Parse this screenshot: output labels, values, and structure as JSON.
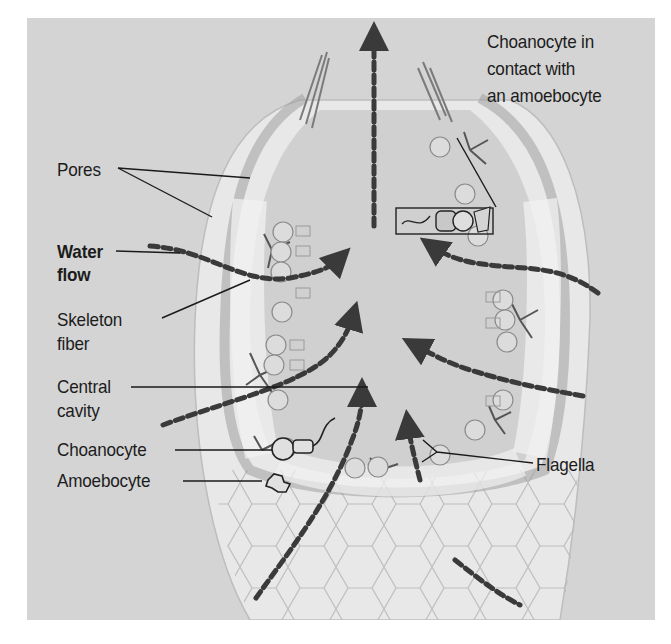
{
  "diagram": {
    "labels": {
      "pores": "Pores",
      "water_flow_line1": "Water",
      "water_flow_line2": "flow",
      "skeleton_fiber_line1": "Skeleton",
      "skeleton_fiber_line2": "fiber",
      "central_cavity_line1": "Central",
      "central_cavity_line2": "cavity",
      "choanocyte": "Choanocyte",
      "amoebocyte": "Amoebocyte",
      "choanocyte_contact_line1": "Choanocyte in",
      "choanocyte_contact_line2": "contact with",
      "choanocyte_contact_line3": "an amoebocyte",
      "flagella": "Flagella"
    },
    "colors": {
      "background_panel": "#d4d4d4",
      "page_background": "#ffffff",
      "label_text": "#1c1c1c",
      "leader_lines": "#1a1a1a",
      "flow_arrows": "#3a3a3a",
      "sponge_wall": "#e6e6e6",
      "sponge_wall_dark": "#a8a8a8"
    }
  }
}
